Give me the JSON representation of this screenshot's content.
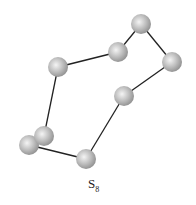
{
  "diagram": {
    "label_main": "S",
    "label_sub": "8",
    "atom_color": "#b8b8b8",
    "bond_color": "#222222",
    "atoms": [
      {
        "x": 141,
        "y": 24
      },
      {
        "x": 172,
        "y": 62
      },
      {
        "x": 124,
        "y": 96
      },
      {
        "x": 86,
        "y": 159
      },
      {
        "x": 29,
        "y": 145
      },
      {
        "x": 44,
        "y": 136
      },
      {
        "x": 58,
        "y": 67
      },
      {
        "x": 118,
        "y": 52
      }
    ]
  }
}
